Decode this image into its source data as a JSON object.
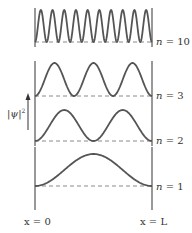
{
  "diagram": {
    "y_axis_label": "|ψ|²",
    "y_axis_label_base": "|ψ|",
    "y_axis_label_sup": "2",
    "x_left_label": "x = 0",
    "x_right_label": "x = L",
    "colors": {
      "curve": "#555555",
      "wall": "#555555",
      "baseline": "#8a8a8a",
      "text": "#333333"
    },
    "panels": [
      {
        "n": 10,
        "label": "n = 10",
        "label_var": "n",
        "label_val": "= 10",
        "top": 10,
        "baseline": 42
      },
      {
        "n": 3,
        "label": "n = 3",
        "label_var": "n",
        "label_val": "= 3",
        "top": 63,
        "baseline": 96
      },
      {
        "n": 2,
        "label": "n = 2",
        "label_var": "n",
        "label_val": "= 2",
        "top": 110,
        "baseline": 141
      },
      {
        "n": 1,
        "label": "n = 1",
        "label_var": "n",
        "label_val": "= 1",
        "top": 154,
        "baseline": 186
      }
    ]
  }
}
